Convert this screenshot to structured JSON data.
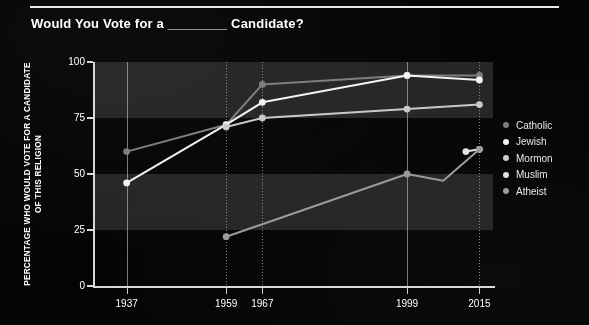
{
  "header": {
    "title": "Would You Vote for a ________ Candidate?",
    "rule_color": "#e8e8e8"
  },
  "theme": {
    "background": "#050505",
    "band_color": "#252525",
    "axis_color": "#d8d8d8",
    "text_color": "#ffffff"
  },
  "legend": {
    "position": "right",
    "items": [
      {
        "label": "Catholic",
        "color": "#7d7d7d"
      },
      {
        "label": "Jewish",
        "color": "#f2f2f2"
      },
      {
        "label": "Mormon",
        "color": "#c9c9c9"
      },
      {
        "label": "Muslim",
        "color": "#e2e2e2"
      },
      {
        "label": "Atheist",
        "color": "#999999"
      }
    ]
  },
  "axes": {
    "y_title": "PERCENTAGE WHO WOULD VOTE FOR A CANDIDATE OF THIS RELIGION",
    "y_ticks": [
      "0",
      "25",
      "50",
      "75",
      "100"
    ],
    "x_ticks": [
      "1937",
      "1959",
      "1967",
      "1999",
      "2015"
    ]
  },
  "chart_data": {
    "type": "line",
    "title": "Would You Vote for a ________ Candidate?",
    "xlabel": "",
    "ylabel": "PERCENTAGE WHO WOULD VOTE FOR A CANDIDATE OF THIS RELIGION",
    "ylim": [
      0,
      100
    ],
    "xlim": [
      1930,
      2018
    ],
    "yticks": [
      0,
      25,
      50,
      75,
      100
    ],
    "xticks": [
      1937,
      1959,
      1967,
      1999,
      2015
    ],
    "grid": "vertical-dotted-at-xticks; horizontal alternating shaded bands (25-50 and 75-100)",
    "legend_position": "right",
    "series": [
      {
        "name": "Catholic",
        "color": "#7d7d7d",
        "x": [
          1937,
          1959,
          1967,
          1999,
          2015
        ],
        "values": [
          60,
          72,
          90,
          94,
          94
        ]
      },
      {
        "name": "Jewish",
        "color": "#f2f2f2",
        "x": [
          1937,
          1959,
          1967,
          1999,
          2015
        ],
        "values": [
          46,
          72,
          82,
          94,
          92
        ]
      },
      {
        "name": "Mormon",
        "color": "#c9c9c9",
        "x": [
          1959,
          1967,
          1999,
          2015
        ],
        "values": [
          71,
          75,
          79,
          81
        ]
      },
      {
        "name": "Muslim",
        "color": "#e2e2e2",
        "x": [
          2012,
          2015
        ],
        "values": [
          60,
          61
        ]
      },
      {
        "name": "Atheist",
        "color": "#999999",
        "x": [
          1959,
          1999,
          2007,
          2015
        ],
        "values": [
          22,
          50,
          47,
          61
        ]
      }
    ]
  }
}
